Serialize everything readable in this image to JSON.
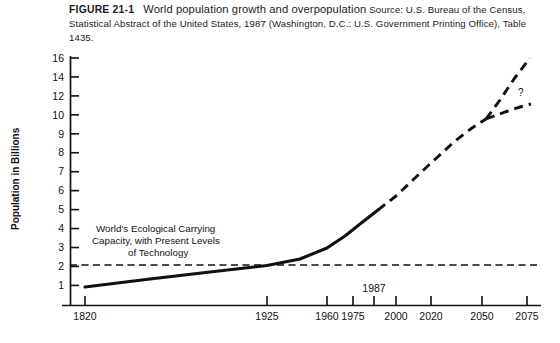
{
  "caption": {
    "figure_number": "FIGURE 21-1",
    "title": "World population growth and overpopulation",
    "source": "Source: U.S. Bureau of the Census, Statistical Abstract of the United States, 1987 (Washington, D.C.: U.S. Government Printing Office), Table 1435."
  },
  "chart_data": {
    "type": "line",
    "title": "World population growth and overpopulation",
    "xlabel": "",
    "ylabel": "Population in Billions",
    "grid": false,
    "legend": "none",
    "xlim": [
      1820,
      2075
    ],
    "ylim": [
      0,
      16
    ],
    "x_ticks": [
      {
        "value": 1820,
        "label": "1820"
      },
      {
        "value": 1925,
        "label": "1925"
      },
      {
        "value": 1960,
        "label": "1960"
      },
      {
        "value": 1975,
        "label": "1975"
      },
      {
        "value": 1987,
        "label": "1987"
      },
      {
        "value": 2000,
        "label": "2000"
      },
      {
        "value": 2020,
        "label": "2020"
      },
      {
        "value": 2050,
        "label": "2050"
      },
      {
        "value": 2075,
        "label": "2075"
      }
    ],
    "y_ticks": [
      {
        "value": 16,
        "label": "16"
      },
      {
        "value": 14,
        "label": "14"
      },
      {
        "value": 12,
        "label": "12"
      },
      {
        "value": 10,
        "label": "10"
      },
      {
        "value": 9,
        "label": "9"
      },
      {
        "value": 8,
        "label": "8"
      },
      {
        "value": 7,
        "label": "7"
      },
      {
        "value": 6,
        "label": "6"
      },
      {
        "value": 5,
        "label": "5"
      },
      {
        "value": 4,
        "label": "4"
      },
      {
        "value": 3,
        "label": "3"
      },
      {
        "value": 2,
        "label": "2"
      },
      {
        "value": 1,
        "label": "1"
      }
    ],
    "series": [
      {
        "name": "Historical population (solid)",
        "style": "solid",
        "x": [
          1820,
          1925,
          1960,
          1975,
          1987
        ],
        "values": [
          1.0,
          2.0,
          3.0,
          4.0,
          5.0
        ]
      },
      {
        "name": "Projected population (dashed)",
        "style": "dashed",
        "x": [
          1987,
          2000,
          2020,
          2050
        ],
        "values": [
          5.0,
          6.3,
          8.3,
          9.8
        ]
      },
      {
        "name": "High projection branch (dashed)",
        "style": "dashed",
        "x": [
          2050,
          2075
        ],
        "values": [
          9.8,
          15.8
        ]
      },
      {
        "name": "Low projection branch (dashed)",
        "style": "dashed",
        "x": [
          2050,
          2075
        ],
        "values": [
          9.8,
          11.5
        ]
      },
      {
        "name": "World's Ecological Carrying Capacity",
        "style": "dashed-horizontal",
        "x": [
          1820,
          2075
        ],
        "values": [
          2.0,
          2.0
        ]
      }
    ],
    "annotations": [
      {
        "name": "carrying-capacity-note",
        "lines": [
          "World's Ecological Carrying",
          "Capacity, with Present Levels",
          "of Technology"
        ]
      },
      {
        "name": "uncertainty-marker",
        "lines": [
          "?"
        ]
      }
    ]
  }
}
